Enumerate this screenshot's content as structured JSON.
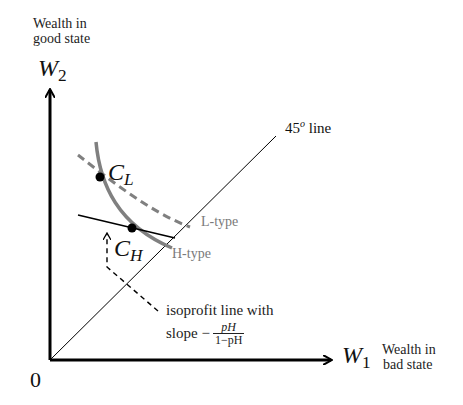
{
  "diagram": {
    "y_axis": {
      "description_line1": "Wealth in",
      "description_line2": "good state",
      "symbol": "W",
      "subscript": "2"
    },
    "x_axis": {
      "description_line1": "Wealth in",
      "description_line2": "bad state",
      "symbol": "W",
      "subscript": "1"
    },
    "origin_label": "0",
    "diagonal": {
      "label_main": "45",
      "label_sup": "o",
      "label_rest": " line"
    },
    "points": [
      {
        "symbol": "C",
        "subscript": "L"
      },
      {
        "symbol": "C",
        "subscript": "H"
      }
    ],
    "curves": [
      {
        "name": "L-type",
        "label": "L-type",
        "style": "dashed",
        "color": "#808080"
      },
      {
        "name": "H-type",
        "label": "H-type",
        "style": "solid",
        "color": "#808080"
      }
    ],
    "isoprofit": {
      "label_line1": "isoprofit line with",
      "label_line2_prefix": "slope −",
      "fraction_numerator": "pH",
      "fraction_denominator": "1−pH"
    },
    "colors": {
      "axis": "#000000",
      "curve_gray": "#808080",
      "label_gray": "#7a7a7a"
    }
  }
}
